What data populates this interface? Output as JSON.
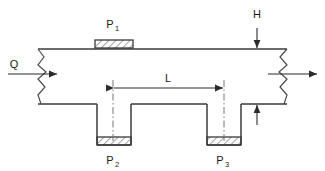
{
  "diagram": {
    "type": "engineering-cross-section",
    "background_color": "#ffffff",
    "line_color": "#3a3a3a",
    "hatch_color": "#555555",
    "text_color": "#1a1a1a",
    "labels": {
      "flow_inlet": "Q",
      "height": "H",
      "length": "L",
      "pressure_top": "P",
      "pressure_top_sub": "1",
      "pressure_left": "P",
      "pressure_left_sub": "2",
      "pressure_right": "P",
      "pressure_right_sub": "3"
    },
    "annotations": {
      "q_meaning": "Q",
      "h_meaning": "H",
      "l_meaning": "L"
    },
    "geometry": {
      "channel_top_y": 49,
      "channel_bottom_y": 104,
      "channel_left_x": 38,
      "channel_right_x": 287,
      "break_left_x": 43,
      "break_right_x": 281,
      "p1_block": {
        "x": 95,
        "y": 40,
        "w": 38,
        "h": 8
      },
      "p2_cavity": {
        "x": 97,
        "y": 104,
        "w": 34,
        "h": 41
      },
      "p3_cavity": {
        "x": 207,
        "y": 104,
        "w": 34,
        "h": 41
      },
      "p2_block": {
        "x": 97,
        "y": 137,
        "w": 34,
        "h": 8
      },
      "p3_block": {
        "x": 207,
        "y": 137,
        "w": 34,
        "h": 8
      },
      "l_dimension": {
        "x1": 113,
        "x2": 224,
        "y": 88
      },
      "h_dimension": {
        "x": 257,
        "y_top": 28,
        "y_bottom": 125
      },
      "q_arrow": {
        "x1": 8,
        "x2": 58,
        "y": 74
      },
      "out_arrow": {
        "x1": 268,
        "x2": 318,
        "y": 74
      }
    }
  }
}
